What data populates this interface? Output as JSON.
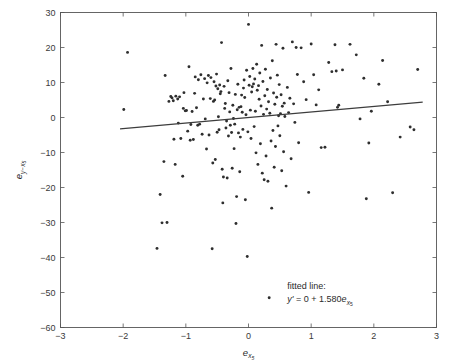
{
  "chart_data": {
    "type": "scatter",
    "title": "",
    "xlabel": "e_x5",
    "xlabel_base": "e",
    "xlabel_sub": "x",
    "xlabel_subsub": "5",
    "ylabel": "e_y-x5",
    "ylabel_base": "e",
    "ylabel_sub": "y−x",
    "ylabel_subsub": "5",
    "xlim": [
      -3,
      3
    ],
    "ylim": [
      -60,
      30
    ],
    "xticks": [
      -3,
      -2,
      -1,
      0,
      1,
      2,
      3
    ],
    "xtick_labels": [
      "−3",
      "−2",
      "−1",
      "0",
      "1",
      "2",
      "3"
    ],
    "yticks": [
      30,
      20,
      10,
      0,
      -10,
      -20,
      -30,
      -40,
      -50,
      -60
    ],
    "ytick_labels": [
      "30",
      "20",
      "10",
      "0",
      "−10",
      "−20",
      "−30",
      "−40",
      "−50",
      "−60"
    ],
    "grid": false,
    "legend": "none",
    "marker_color": "#2e2e2e",
    "marker_size": 1.45,
    "line_color": "#3d3d3d",
    "fit_slope": 1.58,
    "fit_intercept": 0,
    "fit_x_range": [
      -2.05,
      2.78
    ],
    "annotation": {
      "line1": "fitted line:",
      "line2_y": "y'",
      "line2_eq": " = 0 + 1.580",
      "line2_e": "e",
      "line2_sub": "x",
      "line2_subsub": "5",
      "x_data": 0.62,
      "y_data": -49.0
    },
    "points": [
      [
        -1.93,
        18.6
      ],
      [
        -1.99,
        2.3
      ],
      [
        -1.41,
        -22.0
      ],
      [
        -1.46,
        -37.4
      ],
      [
        -1.38,
        -30.1
      ],
      [
        -1.3,
        -30.0
      ],
      [
        -1.33,
        12.0
      ],
      [
        -1.35,
        -12.6
      ],
      [
        -1.27,
        4.6
      ],
      [
        -1.22,
        5.6
      ],
      [
        -1.24,
        6.0
      ],
      [
        -1.2,
        4.8
      ],
      [
        -1.19,
        -6.2
      ],
      [
        -1.17,
        -13.4
      ],
      [
        -1.16,
        6.1
      ],
      [
        -1.13,
        5.3
      ],
      [
        -1.12,
        -1.6
      ],
      [
        -1.1,
        5.9
      ],
      [
        -1.08,
        -6.0
      ],
      [
        -1.05,
        -16.8
      ],
      [
        -1.04,
        2.6
      ],
      [
        -1.03,
        7.1
      ],
      [
        -1.01,
        1.9
      ],
      [
        -0.99,
        2.0
      ],
      [
        -0.97,
        -3.9
      ],
      [
        -0.95,
        14.5
      ],
      [
        -0.93,
        -6.5
      ],
      [
        -0.92,
        -2.0
      ],
      [
        -0.9,
        1.7
      ],
      [
        -0.88,
        -6.3
      ],
      [
        -0.86,
        6.9
      ],
      [
        -0.85,
        11.6
      ],
      [
        -0.83,
        2.8
      ],
      [
        -0.81,
        -2.2
      ],
      [
        -0.8,
        10.8
      ],
      [
        -0.78,
        -1.9
      ],
      [
        -0.76,
        12.2
      ],
      [
        -0.74,
        -4.8
      ],
      [
        -0.72,
        5.3
      ],
      [
        -0.7,
        11.1
      ],
      [
        -0.69,
        -0.4
      ],
      [
        -0.67,
        -9.0
      ],
      [
        -0.66,
        9.9
      ],
      [
        -0.64,
        12.0
      ],
      [
        -0.63,
        -5.0
      ],
      [
        -0.61,
        5.4
      ],
      [
        -0.6,
        11.4
      ],
      [
        -0.58,
        -37.5
      ],
      [
        -0.57,
        -13.0
      ],
      [
        -0.56,
        4.6
      ],
      [
        -0.55,
        10.2
      ],
      [
        -0.54,
        5.0
      ],
      [
        -0.53,
        -12.0
      ],
      [
        -0.52,
        9.0
      ],
      [
        -0.51,
        12.4
      ],
      [
        -0.5,
        -4.2
      ],
      [
        -0.49,
        8.2
      ],
      [
        -0.48,
        0.2
      ],
      [
        -0.47,
        -3.5
      ],
      [
        -0.46,
        9.3
      ],
      [
        -0.45,
        6.8
      ],
      [
        -0.44,
        7.4
      ],
      [
        -0.43,
        21.4
      ],
      [
        -0.42,
        -14.8
      ],
      [
        -0.41,
        -24.4
      ],
      [
        -0.4,
        -17.0
      ],
      [
        -0.39,
        8.9
      ],
      [
        -0.38,
        2.6
      ],
      [
        -0.37,
        4.0
      ],
      [
        -0.36,
        -3.0
      ],
      [
        -0.35,
        -1.0
      ],
      [
        -0.34,
        -17.3
      ],
      [
        -0.33,
        10.5
      ],
      [
        -0.32,
        -5.3
      ],
      [
        -0.31,
        7.1
      ],
      [
        -0.3,
        1.6
      ],
      [
        -0.29,
        -2.2
      ],
      [
        -0.28,
        14.0
      ],
      [
        -0.27,
        -4.3
      ],
      [
        -0.26,
        -14.5
      ],
      [
        -0.25,
        3.5
      ],
      [
        -0.24,
        -0.3
      ],
      [
        -0.23,
        -8.9
      ],
      [
        -0.22,
        -1.9
      ],
      [
        -0.21,
        6.6
      ],
      [
        -0.2,
        -30.3
      ],
      [
        -0.19,
        -22.6
      ],
      [
        -0.18,
        2.2
      ],
      [
        -0.17,
        9.5
      ],
      [
        -0.16,
        -4.4
      ],
      [
        -0.15,
        2.9
      ],
      [
        -0.14,
        -15.5
      ],
      [
        -0.13,
        -5.6
      ],
      [
        -0.12,
        3.1
      ],
      [
        -0.11,
        6.4
      ],
      [
        -0.1,
        1.5
      ],
      [
        -0.09,
        -3.4
      ],
      [
        -0.08,
        8.4
      ],
      [
        -0.07,
        10.7
      ],
      [
        -0.06,
        5.7
      ],
      [
        -0.05,
        -23.5
      ],
      [
        -0.04,
        0.8
      ],
      [
        -0.03,
        13.5
      ],
      [
        -0.02,
        -39.7
      ],
      [
        -0.01,
        -4.1
      ],
      [
        0.0,
        26.6
      ],
      [
        0.01,
        9.2
      ],
      [
        0.02,
        11.7
      ],
      [
        0.03,
        2.1
      ],
      [
        0.04,
        -6.0
      ],
      [
        0.05,
        7.3
      ],
      [
        0.06,
        8.8
      ],
      [
        0.07,
        14.0
      ],
      [
        0.08,
        9.6
      ],
      [
        0.09,
        -2.6
      ],
      [
        0.1,
        11.0
      ],
      [
        0.11,
        1.8
      ],
      [
        0.12,
        -10.1
      ],
      [
        0.13,
        15.2
      ],
      [
        0.14,
        7.8
      ],
      [
        0.15,
        -13.4
      ],
      [
        0.16,
        9.1
      ],
      [
        0.17,
        5.2
      ],
      [
        0.18,
        12.7
      ],
      [
        0.19,
        -7.5
      ],
      [
        0.2,
        3.3
      ],
      [
        0.21,
        20.6
      ],
      [
        0.22,
        -15.9
      ],
      [
        0.23,
        10.3
      ],
      [
        0.24,
        0.9
      ],
      [
        0.25,
        -17.8
      ],
      [
        0.26,
        6.2
      ],
      [
        0.27,
        13.8
      ],
      [
        0.28,
        -11.0
      ],
      [
        0.29,
        2.4
      ],
      [
        0.3,
        8.0
      ],
      [
        0.31,
        -18.2
      ],
      [
        0.32,
        4.5
      ],
      [
        0.33,
        -51.5
      ],
      [
        0.34,
        1.2
      ],
      [
        0.35,
        11.3
      ],
      [
        0.36,
        -6.7
      ],
      [
        0.37,
        -25.9
      ],
      [
        0.38,
        16.2
      ],
      [
        0.39,
        -3.7
      ],
      [
        0.4,
        7.0
      ],
      [
        0.41,
        -14.2
      ],
      [
        0.42,
        3.8
      ],
      [
        0.43,
        -8.3
      ],
      [
        0.44,
        20.9
      ],
      [
        0.45,
        5.8
      ],
      [
        0.46,
        12.1
      ],
      [
        0.47,
        -2.4
      ],
      [
        0.48,
        0.5
      ],
      [
        0.49,
        9.4
      ],
      [
        0.5,
        -5.2
      ],
      [
        0.51,
        1.1
      ],
      [
        0.52,
        6.5
      ],
      [
        0.53,
        -15.2
      ],
      [
        0.54,
        3.2
      ],
      [
        0.55,
        19.8
      ],
      [
        0.56,
        -9.8
      ],
      [
        0.57,
        4.1
      ],
      [
        0.58,
        0.3
      ],
      [
        0.6,
        -19.6
      ],
      [
        0.62,
        8.6
      ],
      [
        0.64,
        1.4
      ],
      [
        0.66,
        5.5
      ],
      [
        0.68,
        -11.8
      ],
      [
        0.7,
        21.6
      ],
      [
        0.72,
        3.9
      ],
      [
        0.74,
        -1.4
      ],
      [
        0.76,
        20.0
      ],
      [
        0.78,
        12.3
      ],
      [
        0.8,
        -7.2
      ],
      [
        0.84,
        19.9
      ],
      [
        0.88,
        10.2
      ],
      [
        0.92,
        5.1
      ],
      [
        0.96,
        -21.4
      ],
      [
        1.0,
        21.0
      ],
      [
        1.04,
        12.2
      ],
      [
        1.08,
        3.6
      ],
      [
        1.12,
        7.9
      ],
      [
        1.16,
        -8.6
      ],
      [
        1.22,
        -8.5
      ],
      [
        1.28,
        15.7
      ],
      [
        1.33,
        13.1
      ],
      [
        1.38,
        20.8
      ],
      [
        1.4,
        13.3
      ],
      [
        1.42,
        2.9
      ],
      [
        1.44,
        3.5
      ],
      [
        1.5,
        13.6
      ],
      [
        1.62,
        20.9
      ],
      [
        1.72,
        17.9
      ],
      [
        1.78,
        -0.4
      ],
      [
        1.84,
        11.2
      ],
      [
        1.88,
        -23.2
      ],
      [
        1.92,
        -7.3
      ],
      [
        1.96,
        1.8
      ],
      [
        2.08,
        9.5
      ],
      [
        2.14,
        16.3
      ],
      [
        2.22,
        4.5
      ],
      [
        2.3,
        -21.5
      ],
      [
        2.42,
        -5.6
      ],
      [
        2.58,
        -2.7
      ],
      [
        2.64,
        -3.5
      ],
      [
        2.7,
        13.7
      ]
    ]
  }
}
